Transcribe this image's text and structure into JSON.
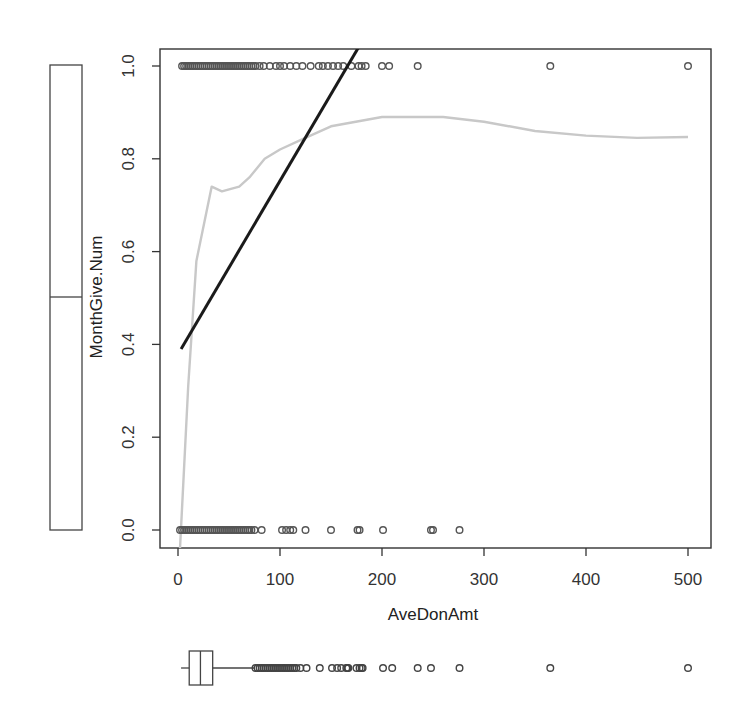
{
  "chart_data": {
    "type": "scatter",
    "title": "",
    "xlabel": "AveDonAmt",
    "ylabel": "MonthGive.Num",
    "xlim": [
      -20,
      520
    ],
    "ylim": [
      -0.04,
      1.04
    ],
    "x_ticks": [
      0,
      100,
      200,
      300,
      400,
      500
    ],
    "y_ticks": [
      0.0,
      0.2,
      0.4,
      0.6,
      0.8,
      1.0
    ],
    "x_tick_labels": [
      "0",
      "100",
      "200",
      "300",
      "400",
      "500"
    ],
    "y_tick_labels": [
      "0.0",
      "0.2",
      "0.4",
      "0.6",
      "0.8",
      "1.0"
    ],
    "grid": false,
    "legend": null,
    "series": [
      {
        "name": "MonthGive = 1 points",
        "kind": "points",
        "y": 1,
        "x": [
          4,
          6,
          8,
          10,
          12,
          14,
          16,
          18,
          20,
          22,
          24,
          26,
          28,
          30,
          32,
          34,
          36,
          38,
          40,
          42,
          44,
          46,
          48,
          50,
          52,
          54,
          56,
          58,
          60,
          62,
          64,
          66,
          68,
          70,
          72,
          74,
          76,
          80,
          84,
          90,
          96,
          100,
          104,
          110,
          116,
          122,
          130,
          138,
          142,
          147,
          152,
          157,
          162,
          170,
          177,
          180,
          184,
          200,
          207,
          235,
          365,
          500
        ]
      },
      {
        "name": "MonthGive = 0 points",
        "kind": "points",
        "y": 0,
        "x": [
          2,
          4,
          6,
          8,
          10,
          12,
          14,
          16,
          18,
          20,
          22,
          24,
          26,
          28,
          30,
          32,
          34,
          36,
          38,
          40,
          42,
          44,
          46,
          48,
          50,
          52,
          54,
          56,
          58,
          60,
          62,
          64,
          66,
          68,
          70,
          72,
          75,
          82,
          102,
          106,
          110,
          113,
          125,
          150,
          176,
          178,
          201,
          248,
          250,
          276
        ]
      },
      {
        "name": "Linear fit",
        "kind": "line",
        "color": "#1a1a1a",
        "x": [
          3,
          177
        ],
        "y": [
          0.39,
          1.04
        ]
      },
      {
        "name": "Loess smooth",
        "kind": "line",
        "color": "#c8c8c8",
        "x": [
          2,
          10,
          18,
          33,
          43,
          60,
          70,
          85,
          100,
          120,
          150,
          200,
          230,
          260,
          300,
          350,
          400,
          450,
          500
        ],
        "y": [
          -0.04,
          0.31,
          0.58,
          0.74,
          0.73,
          0.74,
          0.76,
          0.8,
          0.82,
          0.84,
          0.87,
          0.89,
          0.89,
          0.89,
          0.88,
          0.86,
          0.85,
          0.845,
          0.847
        ]
      },
      {
        "name": "MonthGive.Num boxplot",
        "kind": "boxplot",
        "orientation": "vertical",
        "min": 0,
        "q1": 0,
        "median": 0.5,
        "q3": 1,
        "max": 1
      },
      {
        "name": "AveDonAmt boxplot",
        "kind": "boxplot",
        "orientation": "horizontal",
        "min": 3,
        "q1": 11,
        "median": 22,
        "q3": 34,
        "max": 75,
        "outliers": [
          76,
          78,
          80,
          82,
          84,
          86,
          88,
          90,
          92,
          94,
          96,
          98,
          100,
          102,
          104,
          106,
          108,
          110,
          112,
          114,
          116,
          120,
          126,
          139,
          151,
          156,
          160,
          165,
          166,
          167,
          175,
          178,
          180,
          181,
          201,
          210,
          235,
          248,
          276,
          365,
          500
        ]
      }
    ]
  }
}
